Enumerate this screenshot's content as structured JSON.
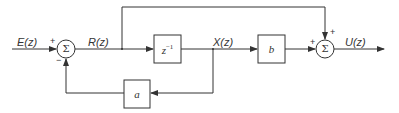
{
  "diagram": {
    "type": "block-diagram",
    "signals": {
      "input": "E(z)",
      "r": "R(z)",
      "x": "X(z)",
      "output": "U(z)"
    },
    "blocks": {
      "delay": {
        "base": "z",
        "exp": "−1"
      },
      "forward_gain": "b",
      "feedback_gain": "a"
    },
    "summers": {
      "sum1": {
        "symbol": "Σ",
        "signs": {
          "left": "+",
          "bottom": "−"
        }
      },
      "sum2": {
        "symbol": "Σ",
        "signs": {
          "left": "+",
          "top": "+"
        }
      }
    },
    "colors": {
      "line": "#333333",
      "background": "#ffffff"
    }
  }
}
